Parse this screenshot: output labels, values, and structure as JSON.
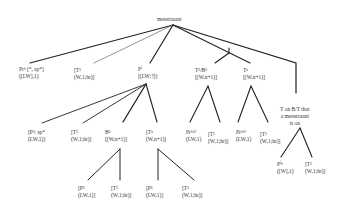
{
  "diagram": {
    "root": {
      "label": "menstruant"
    },
    "level1": [
      {
        "id": "n1",
        "line1": "Prᵇ [*, sp*]",
        "line2": "([LW],1)"
      },
      {
        "id": "n2",
        "line1": "[T¹",
        "line2": "(W,1;hr)]"
      },
      {
        "id": "n3",
        "line1": "Pⁱ",
        "line2": "[(LW;?)]"
      },
      {
        "id": "n4",
        "line1": "T¹/B¹",
        "line2": "[(W,n+1)]"
      },
      {
        "id": "n5",
        "line1": "Tⁿ",
        "line2": "[(W,n+1)]"
      },
      {
        "id": "n6",
        "line1": "T on B/T that",
        "line2": "a menstruant",
        "line3": "is on"
      }
    ],
    "level2": [
      {
        "id": "n3a",
        "parent": "n3",
        "line1": "[P¹: sp*",
        "line2": "(LW,1)]"
      },
      {
        "id": "n3b",
        "parent": "n3",
        "line1": "[T¹",
        "line2": "(W,1;hr)]"
      },
      {
        "id": "n3c",
        "parent": "n3",
        "line1": "B¹",
        "line2": "[(W,n+1)]"
      },
      {
        "id": "n3d",
        "parent": "n3",
        "line1": "[Tⁿ",
        "line2": "(W,n+1)]"
      },
      {
        "id": "n4a",
        "parent": "n4",
        "line1": "Prᵇ⁽ᵃ⁾",
        "line2": "(LW,1)"
      },
      {
        "id": "n4b",
        "parent": "n4",
        "line1": "[T¹",
        "line2": "(W,1;hr)]"
      },
      {
        "id": "n5a",
        "parent": "n5",
        "line1": "Prᵇ⁽ᵃ⁾",
        "line2": "(LW,1)"
      },
      {
        "id": "n5b",
        "parent": "n5",
        "line1": "[T¹",
        "line2": "(W,1;hr)]"
      },
      {
        "id": "n6a",
        "parent": "n6",
        "line1": "Pⁱᵇ",
        "line2": "([W],1)"
      },
      {
        "id": "n6b",
        "parent": "n6",
        "line1": "[T¹",
        "line2": "(W,1;hr)]"
      }
    ],
    "level3": [
      {
        "id": "n3ca",
        "parent": "n3c",
        "line1": "[P¹",
        "line2": "(LW,1)]"
      },
      {
        "id": "n3cb",
        "parent": "n3c",
        "line1": "[T¹",
        "line2": "(W,1;hr)]"
      },
      {
        "id": "n3da",
        "parent": "n3d",
        "line1": "[P¹",
        "line2": "(LW,1)]"
      },
      {
        "id": "n3db",
        "parent": "n3d",
        "line1": "[T¹",
        "line2": "(W,1;hr)]"
      }
    ]
  }
}
